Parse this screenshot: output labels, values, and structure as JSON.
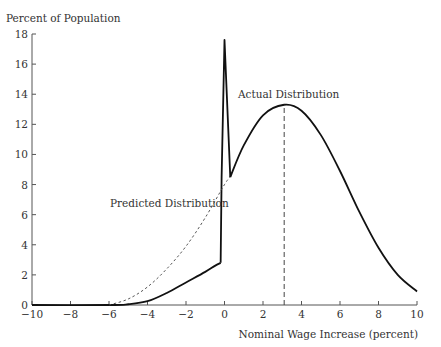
{
  "chart_data": {
    "type": "line",
    "title": "",
    "xlabel": "Nominal Wage Increase (percent)",
    "ylabel": "Percent of Population",
    "xlim": [
      -10,
      10
    ],
    "ylim": [
      0,
      18
    ],
    "xticks": [
      -10,
      -8,
      -6,
      -4,
      -2,
      0,
      2,
      4,
      6,
      8,
      10
    ],
    "yticks": [
      0,
      2,
      4,
      6,
      8,
      10,
      12,
      14,
      16,
      18
    ],
    "xtick_labels": [
      "−10",
      "−8",
      "−6",
      "−4",
      "−2",
      "0",
      "2",
      "4",
      "6",
      "8",
      "10"
    ],
    "ytick_labels": [
      "0",
      "2",
      "4",
      "6",
      "8",
      "10",
      "12",
      "14",
      "16",
      "18"
    ],
    "grid": false,
    "legend": "none (inline annotations)",
    "series": [
      {
        "name": "Actual Distribution",
        "style": "solid",
        "x": [
          -10,
          -6,
          -5,
          -4,
          -3,
          -2,
          -1,
          -0.5,
          -0.2,
          -0.15,
          0.0,
          0.3,
          1,
          2,
          3.1,
          4,
          5,
          6,
          7,
          8,
          9,
          10
        ],
        "y": [
          0,
          0,
          0.05,
          0.25,
          0.8,
          1.5,
          2.2,
          2.6,
          2.8,
          8.5,
          17.6,
          8.5,
          10.6,
          12.6,
          13.3,
          12.9,
          11.3,
          8.9,
          6.2,
          3.8,
          2.0,
          0.9
        ]
      },
      {
        "name": "Predicted Distribution",
        "style": "dashed",
        "x": [
          -6,
          -5,
          -4,
          -3,
          -2,
          -1,
          0,
          0.3
        ],
        "y": [
          0,
          0.4,
          1.2,
          2.4,
          3.9,
          5.8,
          8.0,
          8.5
        ]
      },
      {
        "name": "Mean marker",
        "style": "dashed-vertical",
        "x": [
          3.1,
          3.1
        ],
        "y": [
          0,
          13.3
        ]
      }
    ],
    "annotations": [
      {
        "text": "Actual Distribution",
        "x": 3,
        "y": 14.5
      },
      {
        "text": "Predicted Distribution",
        "x": -6,
        "y": 7.2
      }
    ]
  }
}
